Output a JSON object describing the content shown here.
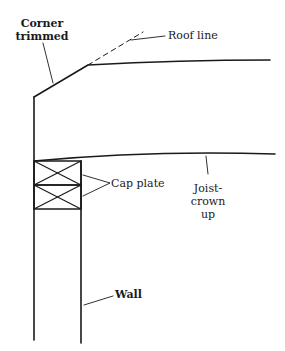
{
  "diagram": {
    "type": "construction-detail",
    "labels": {
      "corner_trimmed_line1": "Corner",
      "corner_trimmed_line2": "trimmed",
      "roof_line": "Roof line",
      "cap_plate": "Cap plate",
      "joist_line1": "Joist-",
      "joist_line2": "crown",
      "joist_line3": "up",
      "wall": "Wall"
    },
    "colors": {
      "ink": "#1a1a1a",
      "background": "#ffffff"
    }
  }
}
